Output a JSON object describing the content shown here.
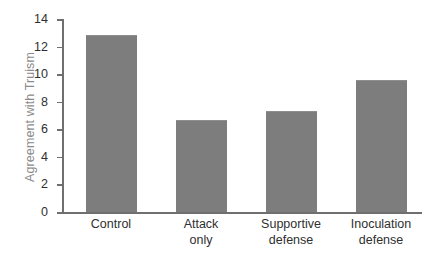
{
  "chart_data": {
    "type": "bar",
    "title": "",
    "xlabel": "",
    "ylabel": "Agreement with Truism",
    "categories": [
      "Control",
      "Attack\nonly",
      "Supportive\ndefense",
      "Inoculation\ndefense"
    ],
    "values": [
      12.75,
      6.6,
      7.25,
      9.5
    ],
    "ylim": [
      0,
      14
    ],
    "yticks": [
      "0",
      "2",
      "4",
      "6",
      "8",
      "10",
      "12",
      "14"
    ],
    "ytick_values": [
      0,
      2,
      4,
      6,
      8,
      10,
      12,
      14
    ],
    "grid": false,
    "legend": null,
    "bar_color": "#7d7d7d",
    "axis_color": "#6f6f6f",
    "label_color": "#2f2f2f",
    "ylabel_color": "#8a8a8a"
  }
}
